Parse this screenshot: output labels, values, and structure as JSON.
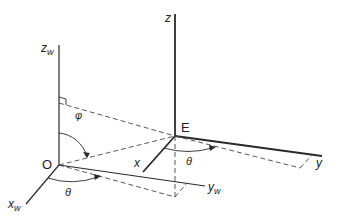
{
  "diagram": {
    "type": "3d-coordinate-frames",
    "colors": {
      "axis": "#2a2a2a",
      "dashed": "#444444",
      "background": "#ffffff"
    },
    "world_frame": {
      "origin_label": "O",
      "axes": {
        "z": "z",
        "z_sub": "w",
        "x": "x",
        "x_sub": "w",
        "y": "y",
        "y_sub": "w"
      }
    },
    "local_frame": {
      "origin_label": "E",
      "axes": {
        "z": "z",
        "x": "x",
        "y": "y"
      }
    },
    "angles": {
      "phi": "φ",
      "theta_world": "θ",
      "theta_local": "θ"
    }
  }
}
